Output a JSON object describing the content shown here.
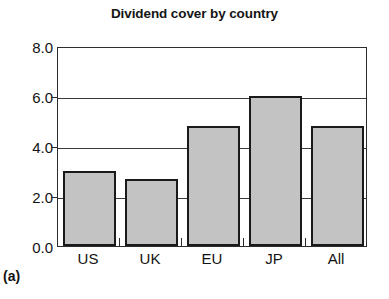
{
  "figure": {
    "panel_label": "(a)",
    "background_color": "#ffffff"
  },
  "chart_data": {
    "type": "bar",
    "title": "Dividend cover by country",
    "xlabel": "",
    "ylabel": "",
    "categories": [
      "US",
      "UK",
      "EU",
      "JP",
      "All"
    ],
    "values": [
      3.0,
      2.7,
      4.8,
      6.0,
      4.8
    ],
    "ylim": [
      0.0,
      8.0
    ],
    "ytick_labels": [
      "0.0",
      "2.0",
      "4.0",
      "6.0",
      "8.0"
    ],
    "ytick_values": [
      0.0,
      2.0,
      4.0,
      6.0,
      8.0
    ],
    "grid": "horizontal",
    "legend": "none",
    "bar_fill_color": "#c3c3c3",
    "bar_edge_color": "#1a1a1a",
    "axis_color": "#2c2c2c"
  }
}
